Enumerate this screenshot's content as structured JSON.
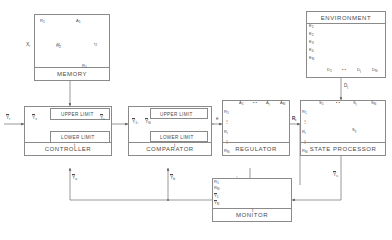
{
  "diagram": {
    "blocks": {
      "memory": {
        "label": "MEMORY"
      },
      "environment": {
        "label": "ENVIRONMENT"
      },
      "controller": {
        "label": "CONTROLLER"
      },
      "comparator": {
        "label": "COMPARATOR"
      },
      "regulator": {
        "label": "REGULATOR"
      },
      "state_processor": {
        "label": "STATE PROCESSOR"
      },
      "monitor": {
        "label": "MONITOR"
      }
    },
    "band_labels": {
      "upper": "UPPER LIMIT",
      "lower": "LOWER LIMIT"
    },
    "memory_plots": [
      {
        "ylabel": "R",
        "ylabel_sub": "1",
        "xlabel": "t",
        "xlabel_sub": "1",
        "shape": "decreasing"
      },
      {
        "ylabel": "A",
        "ylabel_sub": "1",
        "xlabel": "t",
        "xlabel_sub": "2",
        "shape": "increasing"
      },
      {
        "ylabel": "R",
        "ylabel_sub": "2",
        "xlabel": "R",
        "xlabel_sub": "1",
        "shape": "peak"
      }
    ],
    "memory_input": {
      "text": "X",
      "sub": "i"
    },
    "environment_rows": [
      {
        "text": "E",
        "sub": "1"
      },
      {
        "text": "E",
        "sub": "2"
      },
      {
        "text": "E",
        "sub": "3"
      },
      {
        "text": "E",
        "sub": "4"
      },
      {
        "text": "E",
        "sub": "N"
      }
    ],
    "environment_cols": [
      {
        "text": "D",
        "sub": "1"
      },
      {
        "text": "",
        "sub": ""
      },
      {
        "text": "D",
        "sub": "j"
      },
      {
        "text": "",
        "sub": ""
      },
      {
        "text": "D",
        "sub": "N"
      }
    ],
    "environment_output": {
      "text": "D",
      "sub": "j"
    },
    "regulator_cols": [
      {
        "text": "A",
        "sub": "1"
      },
      {
        "text": "",
        "sub": ""
      },
      {
        "text": "A",
        "sub": "j"
      },
      {
        "text": "",
        "sub": ""
      },
      {
        "text": "A",
        "sub": "N"
      }
    ],
    "regulator_rows": [
      {
        "text": "R",
        "sub": "1"
      },
      {
        "text": "",
        "sub": ""
      },
      {
        "text": "R",
        "sub": "i"
      },
      {
        "text": "",
        "sub": ""
      },
      {
        "text": "R",
        "sub": "N"
      }
    ],
    "state_cols": [
      {
        "text": "S",
        "sub": "1"
      },
      {
        "text": "",
        "sub": ""
      },
      {
        "text": "S",
        "sub": "j"
      },
      {
        "text": "",
        "sub": ""
      },
      {
        "text": "S",
        "sub": "N"
      }
    ],
    "state_rows": [
      {
        "text": "R",
        "sub": "1"
      },
      {
        "text": "",
        "sub": ""
      },
      {
        "text": "R",
        "sub": "i"
      },
      {
        "text": "",
        "sub": ""
      },
      {
        "text": "R",
        "sub": "N"
      }
    ],
    "state_cell": {
      "text": "S",
      "sub": "ij"
    },
    "monitor_labels": [
      {
        "text": "R",
        "sub": "1"
      },
      {
        "text": "R",
        "sub": "N"
      },
      {
        "text": "Y",
        "sub": "1",
        "bar": true
      },
      {
        "text": "Y",
        "sub": "N",
        "bar": true
      }
    ],
    "signals": {
      "controller_in": {
        "text": "Y",
        "sub": "r",
        "bar": true
      },
      "controller_sp": {
        "text": "Y",
        "sub": "s",
        "bar": true
      },
      "controller_out": {
        "text": "Y",
        "sub": "c",
        "bar": true
      },
      "comparator_in": {
        "text": "Y",
        "sub": "1",
        "bar": true
      },
      "comparator_in2": {
        "text": "Y",
        "sub": "N",
        "bar": true
      },
      "comparator_out": {
        "text": "e",
        "sub": ""
      },
      "regulator_out": {
        "text": "R",
        "sub": "i"
      },
      "regulator_fb": {
        "text": "R",
        "sub": "k"
      },
      "state_out": {
        "text": "Y",
        "sub": "s",
        "bar": true
      },
      "monitor_out": {
        "text": "Y",
        "sub": "m",
        "bar": true
      },
      "fb_controller": {
        "text": "Y",
        "sub": "a",
        "bar": true
      },
      "fb_comparator": {
        "text": "Y",
        "sub": "b",
        "bar": true
      },
      "comparator_t": {
        "text": "t",
        "sub": ""
      },
      "controller_t": {
        "text": "t",
        "sub": ""
      },
      "monitor_t": {
        "text": "t",
        "sub": ""
      }
    }
  }
}
